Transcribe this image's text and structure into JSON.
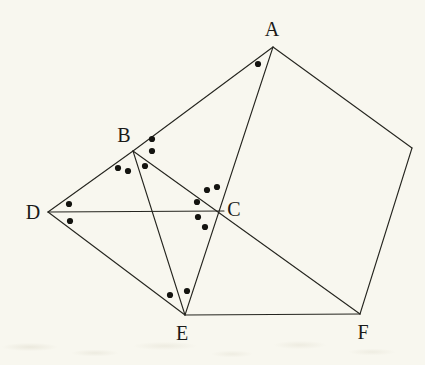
{
  "figure": {
    "kind": "geometry-diagram",
    "background_color": "#f8f7ef",
    "line_color": "#25251f",
    "line_width": 1.1,
    "dot_color": "#141410",
    "dot_radius": 3.1,
    "label_color": "#1a1a18",
    "label_font_size": 20,
    "width": 425,
    "height": 365,
    "points": [
      {
        "id": "A",
        "label": "A",
        "x": 273,
        "y": 47,
        "label_x": 272,
        "label_y": 29
      },
      {
        "id": "B",
        "label": "B",
        "x": 133,
        "y": 151,
        "label_x": 124,
        "label_y": 135
      },
      {
        "id": "C",
        "label": "C",
        "x": 222,
        "y": 211,
        "label_x": 234,
        "label_y": 209
      },
      {
        "id": "D",
        "label": "D",
        "x": 48,
        "y": 212,
        "label_x": 33,
        "label_y": 212
      },
      {
        "id": "E",
        "label": "E",
        "x": 185,
        "y": 315,
        "label_x": 182,
        "label_y": 333
      },
      {
        "id": "F",
        "label": "F",
        "x": 360,
        "y": 314,
        "label_x": 363,
        "label_y": 332
      },
      {
        "id": "G",
        "label": "",
        "x": 412,
        "y": 148,
        "label_x": 412,
        "label_y": 148
      }
    ],
    "segments": [
      {
        "id": "seg-D-B",
        "from": "D",
        "to": "B",
        "x1": 48,
        "y1": 212,
        "x2": 133,
        "y2": 151
      },
      {
        "id": "seg-B-A",
        "from": "B",
        "to": "A",
        "x1": 133,
        "y1": 151,
        "x2": 273,
        "y2": 47
      },
      {
        "id": "seg-A-G",
        "from": "A",
        "to": "G",
        "x1": 273,
        "y1": 47,
        "x2": 412,
        "y2": 148
      },
      {
        "id": "seg-G-F",
        "from": "G",
        "to": "F",
        "x1": 412,
        "y1": 148,
        "x2": 360,
        "y2": 314
      },
      {
        "id": "seg-F-E",
        "from": "F",
        "to": "E",
        "x1": 360,
        "y1": 314,
        "x2": 185,
        "y2": 315
      },
      {
        "id": "seg-E-D",
        "from": "E",
        "to": "D",
        "x1": 185,
        "y1": 315,
        "x2": 48,
        "y2": 212
      },
      {
        "id": "seg-D-C",
        "from": "D",
        "to": "C",
        "x1": 48,
        "y1": 212,
        "x2": 224,
        "y2": 211
      },
      {
        "id": "seg-A-E",
        "from": "A",
        "to": "E",
        "x1": 273,
        "y1": 47,
        "x2": 185,
        "y2": 315
      },
      {
        "id": "seg-B-F",
        "from": "B",
        "to": "F",
        "x1": 133,
        "y1": 151,
        "x2": 360,
        "y2": 314
      },
      {
        "id": "seg-B-E",
        "from": "B",
        "to": "E",
        "x1": 133,
        "y1": 151,
        "x2": 185,
        "y2": 315
      }
    ],
    "angle_dots": [
      {
        "id": "dot-at-A-1",
        "near": "A",
        "x": 258,
        "y": 64
      },
      {
        "id": "dot-at-B-1",
        "near": "B",
        "x": 152,
        "y": 139
      },
      {
        "id": "dot-at-B-2",
        "near": "B",
        "x": 152,
        "y": 151
      },
      {
        "id": "dot-at-B-3",
        "near": "B",
        "x": 118,
        "y": 168
      },
      {
        "id": "dot-at-B-4",
        "near": "B",
        "x": 128,
        "y": 171
      },
      {
        "id": "dot-at-B-5",
        "near": "B",
        "x": 145,
        "y": 166
      },
      {
        "id": "dot-at-D-1",
        "near": "D",
        "x": 69,
        "y": 204
      },
      {
        "id": "dot-at-D-2",
        "near": "D",
        "x": 70,
        "y": 221
      },
      {
        "id": "dot-at-C-1",
        "near": "C",
        "x": 207,
        "y": 190
      },
      {
        "id": "dot-at-C-2",
        "near": "C",
        "x": 217,
        "y": 187
      },
      {
        "id": "dot-at-C-3",
        "near": "C",
        "x": 197,
        "y": 202
      },
      {
        "id": "dot-at-C-4",
        "near": "C",
        "x": 198,
        "y": 217
      },
      {
        "id": "dot-at-C-5",
        "near": "C",
        "x": 205,
        "y": 227
      },
      {
        "id": "dot-at-E-1",
        "near": "E",
        "x": 170,
        "y": 295
      },
      {
        "id": "dot-at-E-2",
        "near": "E",
        "x": 187,
        "y": 291
      }
    ]
  }
}
